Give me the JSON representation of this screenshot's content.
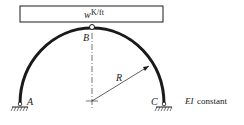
{
  "load": {
    "symbol": "w",
    "units": "K/ft"
  },
  "labels": {
    "A": "A",
    "B": "B",
    "C": "C",
    "R": "R"
  },
  "note": {
    "ei": "EI",
    "constant": "constant"
  },
  "colors": {
    "stroke": "#1a1a1a",
    "background": "#ffffff"
  }
}
